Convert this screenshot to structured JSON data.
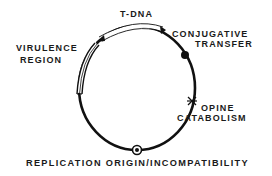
{
  "diagram": {
    "colors": {
      "line": "#111111",
      "background": "#ffffff"
    },
    "labels": {
      "t_dna": "T-DNA",
      "virulence_line1": "VIRULENCE",
      "virulence_line2": "REGION",
      "conjugative_line1": "CONJUGATIVE",
      "conjugative_line2": "TRANSFER",
      "opine_line1": "OPINE",
      "opine_line2": "CATABOLISM",
      "origin": "REPLICATION ORIGIN/INCOMPATIBILITY"
    },
    "regions": [
      {
        "name": "T-DNA",
        "marker": "open-arc-band"
      },
      {
        "name": "Virulence region",
        "marker": "double-line-band"
      },
      {
        "name": "Conjugative transfer",
        "marker": "filled-dot"
      },
      {
        "name": "Opine catabolism",
        "marker": "asterisk"
      },
      {
        "name": "Replication origin/incompatibility",
        "marker": "circled-dot"
      }
    ]
  }
}
